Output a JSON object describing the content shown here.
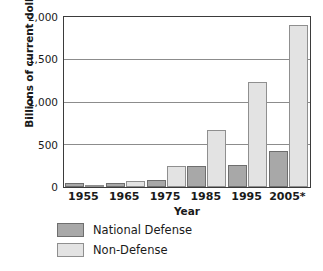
{
  "chart_data": {
    "type": "bar",
    "title": "",
    "subtitle": "",
    "xlabel": "Year",
    "ylabel": "Billions of current dollars",
    "categories": [
      "1955",
      "1965",
      "1975",
      "1985",
      "1995",
      "2005*"
    ],
    "series": [
      {
        "name": "National Defense",
        "color": "#a8a8a8",
        "values": [
          43,
          51,
          87,
          253,
          266,
          421
        ]
      },
      {
        "name": "Non-Defense",
        "color": "#e3e3e3",
        "values": [
          25,
          68,
          245,
          679,
          1238,
          1912
        ]
      }
    ],
    "ylim": [
      0,
      2000
    ],
    "yticks": [
      0,
      500,
      1000,
      1500,
      2000
    ],
    "ytick_labels": [
      "0",
      "500",
      "1,000",
      "1,500",
      "2,000"
    ],
    "grid": true,
    "grid_axis": "y",
    "legend_position": "bottom-left",
    "legend_entries": [
      "National Defense",
      "Non-Defense"
    ]
  },
  "axes": {
    "y_title": "Billions of current dollars",
    "x_title": "Year",
    "y_tick_labels": [
      "2,000",
      "1,500",
      "1,000",
      "500",
      "0"
    ],
    "x_tick_labels": [
      "1955",
      "1965",
      "1975",
      "1985",
      "1995",
      "2005*"
    ]
  },
  "legend": {
    "items": [
      {
        "label": "National Defense",
        "swatch": "dark-gray-swatch"
      },
      {
        "label": "Non-Defense",
        "swatch": "light-gray-swatch"
      }
    ]
  },
  "footer": {
    "cropped_text": ""
  }
}
